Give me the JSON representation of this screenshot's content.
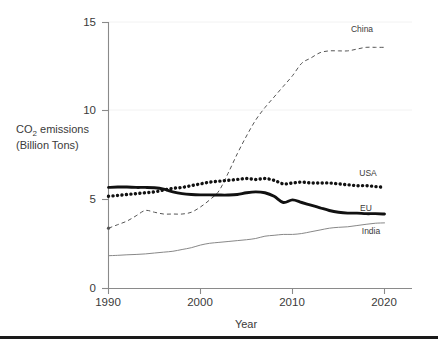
{
  "chart_data": {
    "type": "line",
    "title": "",
    "xlabel": "Year",
    "ylabel": "CO₂ emissions\n(Billion Tons)",
    "ylabel_line1": "CO",
    "ylabel_sub": "2",
    "ylabel_line1_rest": " emissions",
    "ylabel_line2": "(Billion Tons)",
    "xlim": [
      1990,
      2021
    ],
    "ylim": [
      0,
      15
    ],
    "xticks": [
      1990,
      2000,
      2010,
      2020
    ],
    "xtick_labels": [
      "1990",
      "2000",
      "2010",
      "2020"
    ],
    "yticks": [
      0,
      5,
      10,
      15
    ],
    "ytick_labels": [
      "0",
      "5",
      "10",
      "15"
    ],
    "grid": false,
    "legend_position": "inline-right-end-labels",
    "x": [
      1990,
      1991,
      1992,
      1993,
      1994,
      1995,
      1996,
      1997,
      1998,
      1999,
      2000,
      2001,
      2002,
      2003,
      2004,
      2005,
      2006,
      2007,
      2008,
      2009,
      2010,
      2011,
      2012,
      2013,
      2014,
      2015,
      2016,
      2017,
      2018,
      2019,
      2020
    ],
    "series": [
      {
        "name": "China",
        "label": "China",
        "style": "dashed-thin",
        "color": "#555555",
        "values": [
          3.4,
          3.6,
          3.8,
          4.1,
          4.4,
          4.3,
          4.2,
          4.2,
          4.2,
          4.3,
          4.6,
          5.0,
          5.5,
          6.5,
          7.6,
          8.6,
          9.5,
          10.2,
          10.8,
          11.4,
          12.0,
          12.7,
          13.0,
          13.3,
          13.4,
          13.4,
          13.4,
          13.5,
          13.6,
          13.6,
          13.6
        ]
      },
      {
        "name": "USA",
        "label": "USA",
        "style": "dotted-thick",
        "color": "#111111",
        "values": [
          5.2,
          5.25,
          5.3,
          5.35,
          5.4,
          5.45,
          5.55,
          5.65,
          5.7,
          5.8,
          5.9,
          6.0,
          6.05,
          6.1,
          6.15,
          6.2,
          6.15,
          6.2,
          6.1,
          5.9,
          5.95,
          6.0,
          5.95,
          5.95,
          5.95,
          5.9,
          5.85,
          5.8,
          5.8,
          5.75,
          5.7
        ]
      },
      {
        "name": "EU",
        "label": "EU",
        "style": "solid-thick",
        "color": "#111111",
        "values": [
          5.7,
          5.72,
          5.72,
          5.7,
          5.7,
          5.68,
          5.6,
          5.45,
          5.35,
          5.3,
          5.28,
          5.28,
          5.27,
          5.27,
          5.3,
          5.4,
          5.45,
          5.4,
          5.2,
          4.85,
          5.0,
          4.85,
          4.7,
          4.55,
          4.4,
          4.3,
          4.25,
          4.25,
          4.22,
          4.22,
          4.2
        ]
      },
      {
        "name": "India",
        "label": "India",
        "style": "solid-thin",
        "color": "#888888",
        "values": [
          1.85,
          1.87,
          1.9,
          1.92,
          1.95,
          2.0,
          2.05,
          2.1,
          2.2,
          2.3,
          2.45,
          2.55,
          2.6,
          2.65,
          2.7,
          2.75,
          2.82,
          2.95,
          3.0,
          3.05,
          3.05,
          3.1,
          3.2,
          3.3,
          3.4,
          3.45,
          3.48,
          3.55,
          3.62,
          3.68,
          3.7
        ]
      }
    ]
  }
}
